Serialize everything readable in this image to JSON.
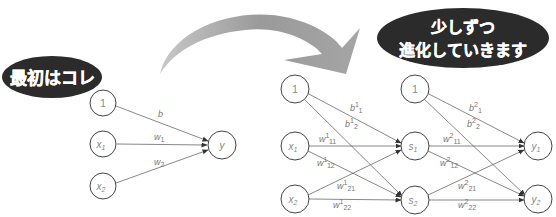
{
  "callouts": {
    "before": "最初はコレ",
    "after_line1": "少しずつ",
    "after_line2": "進化していきます"
  },
  "simple_network": {
    "inputs": [
      {
        "label": "1"
      },
      {
        "label": "x",
        "sub": "1"
      },
      {
        "label": "x",
        "sub": "2"
      }
    ],
    "output": {
      "label": "y"
    },
    "weights": [
      {
        "label": "b",
        "sup": "",
        "sub": ""
      },
      {
        "label": "w",
        "sup": "",
        "sub": "1"
      },
      {
        "label": "w",
        "sup": "",
        "sub": "2"
      }
    ]
  },
  "deep_network": {
    "inputs": [
      {
        "label": "1"
      },
      {
        "label": "x",
        "sub": "1"
      },
      {
        "label": "x",
        "sub": "2"
      }
    ],
    "hidden": [
      {
        "label": "1"
      },
      {
        "label": "s",
        "sub": "1"
      },
      {
        "label": "s",
        "sub": "2"
      }
    ],
    "outputs": [
      {
        "label": "y",
        "sub": "1"
      },
      {
        "label": "y",
        "sub": "2"
      }
    ],
    "layer1_weights": [
      {
        "label": "b",
        "sup": "1",
        "sub": "1"
      },
      {
        "label": "b",
        "sup": "1",
        "sub": "2"
      },
      {
        "label": "w",
        "sup": "1",
        "sub": "11"
      },
      {
        "label": "w",
        "sup": "1",
        "sub": "12"
      },
      {
        "label": "w",
        "sup": "1",
        "sub": "21"
      },
      {
        "label": "w",
        "sup": "1",
        "sub": "22"
      }
    ],
    "layer2_weights": [
      {
        "label": "b",
        "sup": "2",
        "sub": "1"
      },
      {
        "label": "b",
        "sup": "2",
        "sub": "2"
      },
      {
        "label": "w",
        "sup": "2",
        "sub": "11"
      },
      {
        "label": "w",
        "sup": "2",
        "sub": "12"
      },
      {
        "label": "w",
        "sup": "2",
        "sub": "21"
      },
      {
        "label": "w",
        "sup": "2",
        "sub": "22"
      }
    ]
  },
  "colors": {
    "bubble": "#2b2b2b",
    "arrow": "#9a9a9a",
    "edge": "#555555",
    "label": "#888888"
  }
}
